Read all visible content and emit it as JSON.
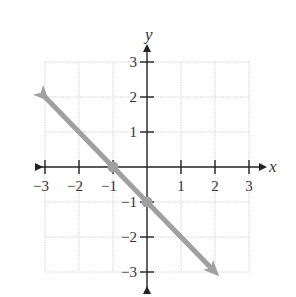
{
  "chart_data": {
    "type": "line",
    "title": "",
    "xlabel": "x",
    "ylabel": "y",
    "xlim": [
      -3,
      3
    ],
    "ylim": [
      -3,
      3
    ],
    "grid": true,
    "x_ticks": [
      "-3",
      "-2",
      "-1",
      "1",
      "2",
      "3"
    ],
    "y_ticks": [
      "3",
      "2",
      "1",
      "-1",
      "-2",
      "-3"
    ],
    "series": [
      {
        "name": "line",
        "equation": "y = -x - 1",
        "x": [
          -3,
          2
        ],
        "y": [
          2,
          -3
        ],
        "arrows_both_ends": true,
        "marked_points": [
          {
            "x": -1,
            "y": 0
          },
          {
            "x": 0,
            "y": -1
          }
        ]
      }
    ],
    "colors": {
      "line": "#a0a0a0",
      "axis": "#222222",
      "grid": "#d4d4d4"
    }
  }
}
